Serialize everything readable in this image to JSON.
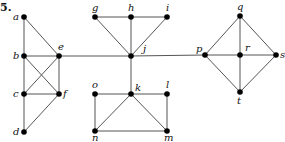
{
  "problem_number": "5.",
  "graph": {
    "nodes": [
      {
        "id": "a",
        "x": 24,
        "y": 17,
        "lx": 13,
        "ly": 20
      },
      {
        "id": "b",
        "x": 24,
        "y": 56,
        "lx": 13,
        "ly": 59
      },
      {
        "id": "c",
        "x": 24,
        "y": 94,
        "lx": 13,
        "ly": 97
      },
      {
        "id": "d",
        "x": 24,
        "y": 132,
        "lx": 13,
        "ly": 135
      },
      {
        "id": "e",
        "x": 59,
        "y": 56,
        "lx": 58,
        "ly": 50
      },
      {
        "id": "f",
        "x": 59,
        "y": 94,
        "lx": 63,
        "ly": 97
      },
      {
        "id": "g",
        "x": 95,
        "y": 17,
        "lx": 92,
        "ly": 11
      },
      {
        "id": "h",
        "x": 131,
        "y": 17,
        "lx": 128,
        "ly": 11
      },
      {
        "id": "i",
        "x": 167,
        "y": 17,
        "lx": 166,
        "ly": 11
      },
      {
        "id": "j",
        "x": 131,
        "y": 56,
        "lx": 143,
        "ly": 52
      },
      {
        "id": "k",
        "x": 131,
        "y": 94,
        "lx": 135,
        "ly": 91
      },
      {
        "id": "l",
        "x": 167,
        "y": 94,
        "lx": 166,
        "ly": 88
      },
      {
        "id": "m",
        "x": 167,
        "y": 131,
        "lx": 164,
        "ly": 141
      },
      {
        "id": "n",
        "x": 95,
        "y": 131,
        "lx": 92,
        "ly": 141
      },
      {
        "id": "o",
        "x": 95,
        "y": 94,
        "lx": 92,
        "ly": 88
      },
      {
        "id": "p",
        "x": 205,
        "y": 55,
        "lx": 196,
        "ly": 52
      },
      {
        "id": "q",
        "x": 240,
        "y": 16,
        "lx": 237,
        "ly": 10
      },
      {
        "id": "r",
        "x": 240,
        "y": 55,
        "lx": 245,
        "ly": 51
      },
      {
        "id": "s",
        "x": 276,
        "y": 55,
        "lx": 280,
        "ly": 58
      },
      {
        "id": "t",
        "x": 240,
        "y": 92,
        "lx": 237,
        "ly": 104
      }
    ],
    "edges": [
      [
        "a",
        "b"
      ],
      [
        "a",
        "e"
      ],
      [
        "b",
        "c"
      ],
      [
        "c",
        "d"
      ],
      [
        "b",
        "e"
      ],
      [
        "b",
        "f"
      ],
      [
        "c",
        "e"
      ],
      [
        "c",
        "f"
      ],
      [
        "e",
        "f"
      ],
      [
        "d",
        "f"
      ],
      [
        "e",
        "j"
      ],
      [
        "g",
        "h"
      ],
      [
        "h",
        "i"
      ],
      [
        "g",
        "j"
      ],
      [
        "h",
        "j"
      ],
      [
        "i",
        "j"
      ],
      [
        "j",
        "k"
      ],
      [
        "j",
        "p"
      ],
      [
        "o",
        "k"
      ],
      [
        "k",
        "l"
      ],
      [
        "o",
        "n"
      ],
      [
        "l",
        "m"
      ],
      [
        "n",
        "k"
      ],
      [
        "k",
        "m"
      ],
      [
        "n",
        "m"
      ],
      [
        "p",
        "q"
      ],
      [
        "q",
        "s"
      ],
      [
        "p",
        "r"
      ],
      [
        "r",
        "s"
      ],
      [
        "q",
        "r"
      ],
      [
        "r",
        "t"
      ],
      [
        "p",
        "t"
      ],
      [
        "t",
        "s"
      ]
    ]
  }
}
